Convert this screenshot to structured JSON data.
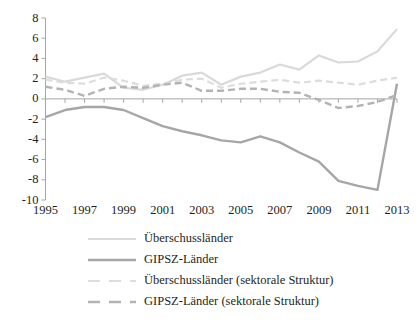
{
  "chart_data": {
    "type": "line",
    "title": "",
    "subtitle": "",
    "xlabel": "",
    "ylabel": "",
    "x": [
      1995,
      1996,
      1997,
      1998,
      1999,
      2000,
      2001,
      2002,
      2003,
      2004,
      2005,
      2006,
      2007,
      2008,
      2009,
      2010,
      2011,
      2012,
      2013
    ],
    "xlim": [
      1995,
      2013
    ],
    "ylim": [
      -10,
      8
    ],
    "yticks": [
      -10,
      -8,
      -6,
      -4,
      -2,
      0,
      2,
      4,
      6,
      8
    ],
    "xticks": [
      1995,
      1997,
      1999,
      2001,
      2003,
      2005,
      2007,
      2009,
      2011,
      2013
    ],
    "xtick_labels": [
      "1995",
      "1997",
      "1999",
      "2001",
      "2003",
      "2005",
      "2007",
      "2009",
      "2011",
      "2013"
    ],
    "ytick_labels": [
      "8",
      "6",
      "4",
      "2",
      "0",
      "-2",
      "-4",
      "-6",
      "-8",
      "-10"
    ],
    "grid": false,
    "legend_position": "bottom-left",
    "series": [
      {
        "name": "Überschussländer",
        "style": "solid",
        "color": "#d9d9d9",
        "width": 2.2,
        "values": [
          2.2,
          1.7,
          2.1,
          2.5,
          1.1,
          0.9,
          1.4,
          2.3,
          2.6,
          1.4,
          2.2,
          2.6,
          3.4,
          2.9,
          4.3,
          3.6,
          3.7,
          4.7,
          6.9
        ]
      },
      {
        "name": "GIPSZ-Länder",
        "style": "solid",
        "color": "#a6a6a6",
        "width": 2.4,
        "values": [
          -1.8,
          -1.1,
          -0.8,
          -0.8,
          -1.1,
          -1.9,
          -2.7,
          -3.2,
          -3.6,
          -4.1,
          -4.3,
          -3.7,
          -4.3,
          -5.3,
          -6.2,
          -8.1,
          -8.6,
          -9.0,
          1.5
        ]
      },
      {
        "name": "Überschussländer (sektorale Struktur)",
        "style": "dashed",
        "color": "#dcdcdc",
        "width": 2.2,
        "values": [
          1.9,
          1.6,
          1.5,
          2.1,
          1.8,
          1.3,
          1.5,
          1.9,
          2.0,
          1.1,
          1.5,
          1.7,
          1.9,
          1.6,
          1.8,
          1.6,
          1.4,
          1.8,
          2.1
        ]
      },
      {
        "name": "GIPSZ-Länder (sektorale Struktur)",
        "style": "dashed",
        "color": "#b3b3b3",
        "width": 2.4,
        "values": [
          1.2,
          0.9,
          0.3,
          1.0,
          1.2,
          1.1,
          1.4,
          1.6,
          0.8,
          0.8,
          1.0,
          1.0,
          0.7,
          0.6,
          -0.1,
          -0.9,
          -0.7,
          -0.3,
          0.4
        ]
      }
    ]
  },
  "axes": {
    "axis_color": "#a6a6a6",
    "zero_line_color": "#a6a6a6"
  },
  "legend": {
    "items": [
      {
        "label": "Überschussländer"
      },
      {
        "label": "GIPSZ-Länder"
      },
      {
        "label": "Überschussländer (sektorale Struktur)"
      },
      {
        "label": "GIPSZ-Länder (sektorale Struktur)"
      }
    ]
  },
  "footer": {
    "text": ""
  }
}
